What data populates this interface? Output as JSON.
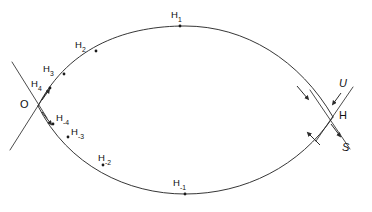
{
  "figure": {
    "kind": "phase-portrait-diagram",
    "stroke_color": "#2b2b2b",
    "text_color": "#111111",
    "background": "#ffffff",
    "width": 372,
    "height": 212
  },
  "fixed_points": [
    {
      "id": "O",
      "label": "O",
      "style": "upright",
      "x": 38,
      "y": 106,
      "label_x": 22,
      "label_y": 100
    },
    {
      "id": "H",
      "label": "H",
      "style": "upright",
      "x": 333,
      "y": 117,
      "label_x": 340,
      "label_y": 111
    }
  ],
  "manifold_labels": [
    {
      "id": "U",
      "label": "U",
      "style": "italic",
      "meaning": "unstable-manifold",
      "x": 341,
      "y": 84
    },
    {
      "id": "S",
      "label": "S",
      "style": "italic",
      "meaning": "stable-manifold",
      "x": 344,
      "y": 148
    }
  ],
  "orbit_points": [
    {
      "id": "H1",
      "base": "H",
      "sub": "1",
      "point_x": 180,
      "point_y": 26,
      "label_x": 172,
      "label_y": 11
    },
    {
      "id": "H2",
      "base": "H",
      "sub": "2",
      "point_x": 96,
      "point_y": 51,
      "label_x": 76,
      "label_y": 41
    },
    {
      "id": "H3",
      "base": "H",
      "sub": "3",
      "point_x": 64,
      "point_y": 74,
      "label_x": 44,
      "label_y": 65
    },
    {
      "id": "H4",
      "base": "H",
      "sub": "4",
      "point_x": 50,
      "point_y": 88,
      "label_x": 32,
      "label_y": 80
    },
    {
      "id": "Hm4",
      "base": "H",
      "sub": "-4",
      "point_x": 53,
      "point_y": 124,
      "label_x": 57,
      "label_y": 114
    },
    {
      "id": "Hm3",
      "base": "H",
      "sub": "-3",
      "point_x": 68,
      "point_y": 137,
      "label_x": 72,
      "label_y": 128
    },
    {
      "id": "Hm2",
      "base": "H",
      "sub": "-2",
      "point_x": 103,
      "point_y": 165,
      "label_x": 99,
      "label_y": 154
    },
    {
      "id": "Hm1",
      "base": "H",
      "sub": "-1",
      "point_x": 185,
      "point_y": 194,
      "label_x": 174,
      "label_y": 179
    }
  ],
  "arcs": [
    {
      "id": "upper-arc",
      "from": "O",
      "to": "H",
      "direction": "clockwise-toward-H"
    },
    {
      "id": "lower-arc",
      "from": "H",
      "to": "O",
      "direction": "clockwise-toward-O"
    }
  ],
  "arrowheads": [
    {
      "id": "upper-arc-arrow-near-O",
      "on": "upper-arc",
      "x": 46,
      "y": 94,
      "angle": -58
    },
    {
      "id": "upper-arc-arrow-near-H",
      "on": "upper-arc",
      "x": 305,
      "y": 95,
      "angle": 40
    },
    {
      "id": "lower-arc-arrow-near-O",
      "on": "lower-arc",
      "x": 48,
      "y": 119,
      "angle": 52
    },
    {
      "id": "lower-arc-arrow-near-H",
      "on": "lower-arc",
      "x": 312,
      "y": 137,
      "angle": 215
    },
    {
      "id": "unstable-line-arrow",
      "on": "U-line",
      "x": 334,
      "y": 101,
      "angle": 118
    },
    {
      "id": "stable-line-arrow",
      "on": "S-line",
      "x": 339,
      "y": 133,
      "angle": 62
    }
  ],
  "crossing_lines": [
    {
      "id": "O-line-upleft",
      "x1": 12,
      "y1": 62,
      "x2": 44,
      "y2": 114
    },
    {
      "id": "O-line-downleft",
      "x1": 10,
      "y1": 148,
      "x2": 46,
      "y2": 92
    },
    {
      "id": "H-line-U",
      "x1": 352,
      "y1": 88,
      "x2": 318,
      "y2": 139
    },
    {
      "id": "H-line-S",
      "x1": 312,
      "y1": 92,
      "x2": 348,
      "y2": 146
    }
  ]
}
